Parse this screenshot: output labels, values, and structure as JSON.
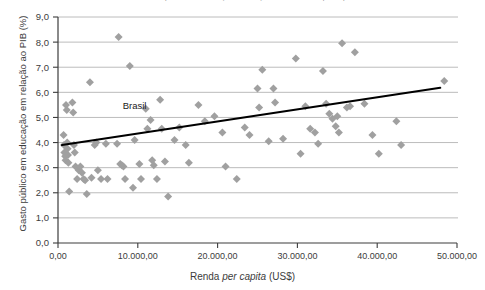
{
  "chart_data": {
    "type": "scatter",
    "title": "Gráfico 1 – Gasto público em educação em relação ao PIB e renda per capita – 2010",
    "xlabel": "Renda per capita (US$)",
    "ylabel": "Gasto público em educação em relação ao PIB (%)",
    "xlim": [
      0,
      50000
    ],
    "ylim": [
      0,
      9
    ],
    "xticks": [
      0,
      10000,
      20000,
      30000,
      40000,
      50000
    ],
    "xtick_labels": [
      "0,00",
      "10.000,00",
      "20.000,00",
      "30.000,00",
      "40.000,00",
      "50.000,00"
    ],
    "yticks": [
      0,
      1,
      2,
      3,
      4,
      5,
      6,
      7,
      8,
      9
    ],
    "ytick_labels": [
      "0,0",
      "1,0",
      "2,0",
      "3,0",
      "4,0",
      "5,0",
      "6,0",
      "7,0",
      "8,0",
      "9,0"
    ],
    "grid": "horizontal",
    "legend": "none",
    "marker": "diamond",
    "marker_color": "#a0a0a0",
    "trendline": {
      "label": "linha de tendência",
      "color": "#000000",
      "x_start": 500,
      "y_start": 3.9,
      "x_end": 47900,
      "y_end": 6.18
    },
    "annotations": [
      {
        "text": "Brasil",
        "x": 9600,
        "y": 5.35,
        "point_x": 9600,
        "point_y": 4.1
      }
    ],
    "points": [
      {
        "x": 700,
        "y": 4.3
      },
      {
        "x": 750,
        "y": 3.9
      },
      {
        "x": 800,
        "y": 3.6
      },
      {
        "x": 900,
        "y": 3.45
      },
      {
        "x": 950,
        "y": 3.3
      },
      {
        "x": 1000,
        "y": 5.5
      },
      {
        "x": 1100,
        "y": 5.3
      },
      {
        "x": 1150,
        "y": 4.0
      },
      {
        "x": 1200,
        "y": 3.75
      },
      {
        "x": 1250,
        "y": 3.5
      },
      {
        "x": 1300,
        "y": 3.2
      },
      {
        "x": 1400,
        "y": 2.05
      },
      {
        "x": 1800,
        "y": 5.6
      },
      {
        "x": 1900,
        "y": 5.2
      },
      {
        "x": 2000,
        "y": 3.9
      },
      {
        "x": 2100,
        "y": 3.6
      },
      {
        "x": 2200,
        "y": 3.05
      },
      {
        "x": 2400,
        "y": 2.55
      },
      {
        "x": 2600,
        "y": 2.9
      },
      {
        "x": 2800,
        "y": 3.05
      },
      {
        "x": 3000,
        "y": 2.8
      },
      {
        "x": 3200,
        "y": 2.55
      },
      {
        "x": 3400,
        "y": 2.5
      },
      {
        "x": 3600,
        "y": 1.95
      },
      {
        "x": 4000,
        "y": 6.4
      },
      {
        "x": 4200,
        "y": 2.6
      },
      {
        "x": 4600,
        "y": 3.9
      },
      {
        "x": 4800,
        "y": 4.0
      },
      {
        "x": 5000,
        "y": 2.9
      },
      {
        "x": 5400,
        "y": 2.55
      },
      {
        "x": 6000,
        "y": 3.95
      },
      {
        "x": 6200,
        "y": 2.55
      },
      {
        "x": 7400,
        "y": 3.95
      },
      {
        "x": 7600,
        "y": 8.2
      },
      {
        "x": 7800,
        "y": 3.15
      },
      {
        "x": 8000,
        "y": 3.1
      },
      {
        "x": 8200,
        "y": 3.05
      },
      {
        "x": 8400,
        "y": 2.55
      },
      {
        "x": 9000,
        "y": 7.05
      },
      {
        "x": 9400,
        "y": 2.2
      },
      {
        "x": 9600,
        "y": 4.1
      },
      {
        "x": 10200,
        "y": 3.15
      },
      {
        "x": 10400,
        "y": 2.55
      },
      {
        "x": 11000,
        "y": 5.35
      },
      {
        "x": 11200,
        "y": 4.55
      },
      {
        "x": 11600,
        "y": 4.9
      },
      {
        "x": 11800,
        "y": 3.3
      },
      {
        "x": 12000,
        "y": 3.1
      },
      {
        "x": 12400,
        "y": 2.55
      },
      {
        "x": 12800,
        "y": 5.7
      },
      {
        "x": 13000,
        "y": 4.55
      },
      {
        "x": 13400,
        "y": 3.25
      },
      {
        "x": 13800,
        "y": 1.85
      },
      {
        "x": 14600,
        "y": 4.1
      },
      {
        "x": 15200,
        "y": 4.6
      },
      {
        "x": 16000,
        "y": 3.9
      },
      {
        "x": 16400,
        "y": 3.2
      },
      {
        "x": 17600,
        "y": 5.5
      },
      {
        "x": 18400,
        "y": 4.85
      },
      {
        "x": 19600,
        "y": 5.05
      },
      {
        "x": 20600,
        "y": 4.4
      },
      {
        "x": 21000,
        "y": 3.05
      },
      {
        "x": 22400,
        "y": 2.55
      },
      {
        "x": 23400,
        "y": 4.6
      },
      {
        "x": 24000,
        "y": 4.3
      },
      {
        "x": 25000,
        "y": 6.15
      },
      {
        "x": 25200,
        "y": 5.4
      },
      {
        "x": 25600,
        "y": 6.9
      },
      {
        "x": 26400,
        "y": 4.05
      },
      {
        "x": 27000,
        "y": 6.15
      },
      {
        "x": 27200,
        "y": 5.6
      },
      {
        "x": 28200,
        "y": 4.15
      },
      {
        "x": 29800,
        "y": 7.35
      },
      {
        "x": 30400,
        "y": 3.55
      },
      {
        "x": 31000,
        "y": 5.45
      },
      {
        "x": 31600,
        "y": 4.55
      },
      {
        "x": 32200,
        "y": 4.4
      },
      {
        "x": 32600,
        "y": 3.95
      },
      {
        "x": 33200,
        "y": 6.85
      },
      {
        "x": 33600,
        "y": 5.55
      },
      {
        "x": 34000,
        "y": 5.15
      },
      {
        "x": 34400,
        "y": 4.95
      },
      {
        "x": 34800,
        "y": 4.65
      },
      {
        "x": 35000,
        "y": 5.05
      },
      {
        "x": 35200,
        "y": 4.4
      },
      {
        "x": 35600,
        "y": 7.95
      },
      {
        "x": 36200,
        "y": 5.4
      },
      {
        "x": 36600,
        "y": 5.45
      },
      {
        "x": 37200,
        "y": 7.6
      },
      {
        "x": 38400,
        "y": 5.55
      },
      {
        "x": 39400,
        "y": 4.3
      },
      {
        "x": 40200,
        "y": 3.55
      },
      {
        "x": 42400,
        "y": 4.85
      },
      {
        "x": 43000,
        "y": 3.9
      },
      {
        "x": 48400,
        "y": 6.45
      }
    ]
  }
}
